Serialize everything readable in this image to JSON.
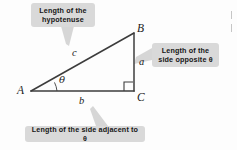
{
  "figure": {
    "type": "right-triangle-trigonometry-diagram",
    "background_color": "#fdfdfd",
    "line_color": "#3c3c3c",
    "callout_fill": "#d9d9d9",
    "callout_text_color": "#161616",
    "leader_color": "#d0d0d0"
  },
  "triangle": {
    "vertices": {
      "A": {
        "label": "A",
        "x": 31,
        "y": 91
      },
      "B": {
        "label": "B",
        "x": 134,
        "y": 33
      },
      "C": {
        "label": "C",
        "x": 134,
        "y": 91
      }
    },
    "sides": {
      "hypotenuse": {
        "label": "c",
        "from": "A",
        "to": "B"
      },
      "opposite": {
        "label": "a",
        "from": "B",
        "to": "C"
      },
      "adjacent": {
        "label": "b",
        "from": "A",
        "to": "C"
      }
    },
    "angle": {
      "label": "θ",
      "at_vertex": "A"
    },
    "right_angle": {
      "at_vertex": "C",
      "marker": "square"
    }
  },
  "callouts": {
    "hypotenuse": {
      "line1": "Length of the",
      "line2": "hypotenuse"
    },
    "opposite": {
      "line1": "Length of the",
      "line2": "side opposite θ"
    },
    "adjacent": {
      "line1": "Length of the side adjacent to θ"
    }
  }
}
